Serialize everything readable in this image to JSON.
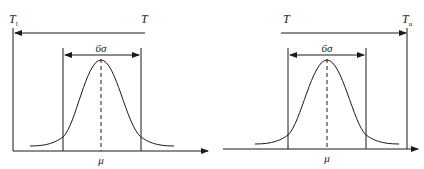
{
  "diagrams": [
    {
      "id": "left",
      "limit_label": "T",
      "limit_subscript": "l",
      "target_label": "T",
      "spread_label": "6σ",
      "mean_label": "μ"
    },
    {
      "id": "right",
      "target_label": "T",
      "limit_label": "T",
      "limit_subscript": "u",
      "spread_label": "6σ",
      "mean_label": "μ"
    }
  ],
  "colors": {
    "stroke": "#1a1a1a",
    "background": "#ffffff"
  }
}
